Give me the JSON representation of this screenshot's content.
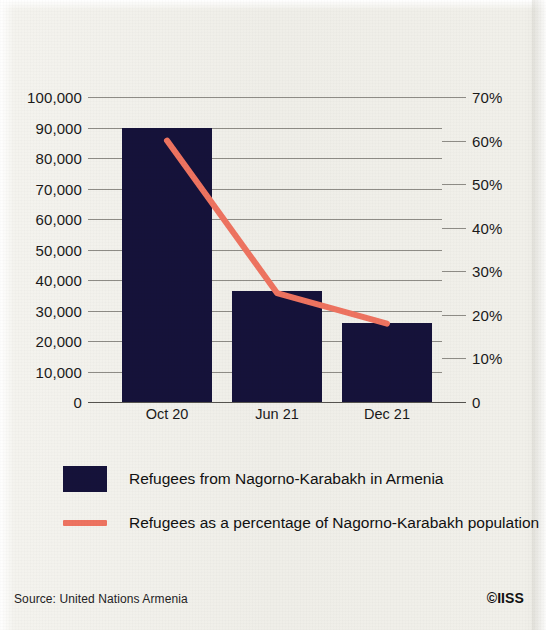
{
  "chart_data": {
    "type": "bar",
    "title": "",
    "subtitle": "",
    "categories": [
      "Oct 20",
      "Jun 21",
      "Dec 21"
    ],
    "xlabel": "",
    "ylabel": "",
    "y2label": "",
    "ylim": [
      0,
      100000
    ],
    "y2lim": [
      0,
      70
    ],
    "yticks": [
      "0",
      "10,000",
      "20,000",
      "30,000",
      "40,000",
      "50,000",
      "60,000",
      "70,000",
      "80,000",
      "90,000",
      "100,000"
    ],
    "ytick_values": [
      0,
      10000,
      20000,
      30000,
      40000,
      50000,
      60000,
      70000,
      80000,
      90000,
      100000
    ],
    "y2ticks": [
      "0",
      "10%",
      "20%",
      "30%",
      "40%",
      "50%",
      "60%",
      "70%"
    ],
    "y2tick_values": [
      0,
      10,
      20,
      30,
      40,
      50,
      60,
      70
    ],
    "grid": true,
    "legend_position": "bottom-left",
    "series": [
      {
        "name": "Refugees from Nagorno-Karabakh in Armenia",
        "type": "bar",
        "axis": "left",
        "color": "#15123a",
        "values": [
          90000,
          36500,
          26000
        ]
      },
      {
        "name": "Refugees as a percentage of Nagorno-Karabakh population",
        "type": "line",
        "axis": "right",
        "color": "#ee7360",
        "values": [
          60,
          25,
          18
        ]
      }
    ]
  },
  "legend": {
    "items": [
      {
        "label": "Refugees from Nagorno-Karabakh in Armenia",
        "marker": "square-swatch",
        "color": "#15123a"
      },
      {
        "label": "Refugees as a percentage of Nagorno-Karabakh population",
        "marker": "line-swatch",
        "color": "#ee7360"
      }
    ]
  },
  "footer": {
    "source": "Source: United Nations Armenia",
    "copyright": "©IISS"
  },
  "colors": {
    "background": "#f1f0ea",
    "bar": "#15123a",
    "line": "#ee7360",
    "grid": "#8e8c86",
    "text": "#1a1a1a"
  }
}
